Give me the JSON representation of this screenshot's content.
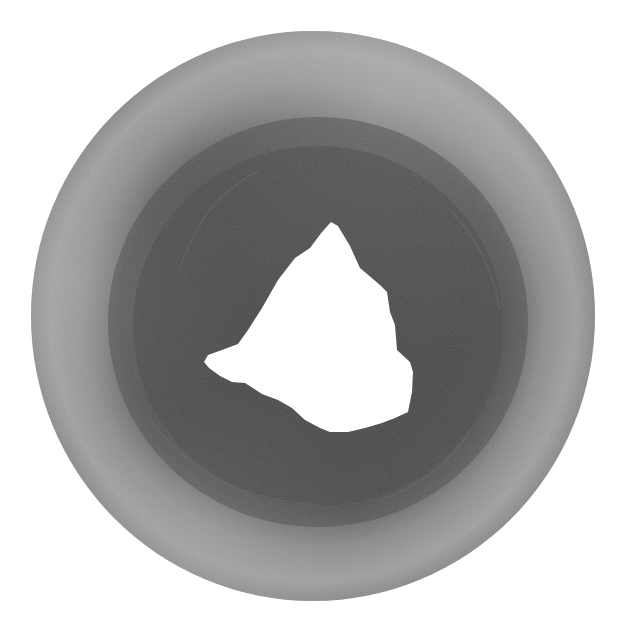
{
  "image": {
    "subject": "grayscale photograph of a ring-shaped object with an irregular central hole",
    "background_color": "#ffffff",
    "colors": {
      "outer_rim_light": "#a5a5a5",
      "outer_rim_mid": "#8a8a8a",
      "inner_band_dark": "#4e4e4e",
      "inner_band_darker": "#444444",
      "hole": "#ffffff"
    }
  }
}
